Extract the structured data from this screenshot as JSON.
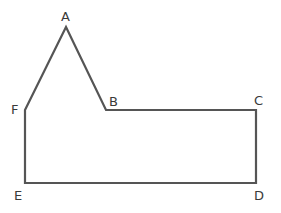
{
  "diagram": {
    "type": "polygon",
    "stroke_color": "#555555",
    "vertices": [
      {
        "id": "A",
        "label": "A",
        "x": 66,
        "y": 27,
        "lx": 61,
        "ly": 21
      },
      {
        "id": "B",
        "label": "B",
        "x": 106,
        "y": 110,
        "lx": 109,
        "ly": 106
      },
      {
        "id": "C",
        "label": "C",
        "x": 256,
        "y": 110,
        "lx": 254,
        "ly": 105
      },
      {
        "id": "D",
        "label": "D",
        "x": 256,
        "y": 183,
        "lx": 254,
        "ly": 200
      },
      {
        "id": "E",
        "label": "E",
        "x": 25,
        "y": 183,
        "lx": 14,
        "ly": 200
      },
      {
        "id": "F",
        "label": "F",
        "x": 25,
        "y": 110,
        "lx": 11,
        "ly": 114
      }
    ],
    "edges": [
      [
        "A",
        "B"
      ],
      [
        "B",
        "C"
      ],
      [
        "C",
        "D"
      ],
      [
        "D",
        "E"
      ],
      [
        "E",
        "F"
      ],
      [
        "F",
        "A"
      ]
    ]
  }
}
